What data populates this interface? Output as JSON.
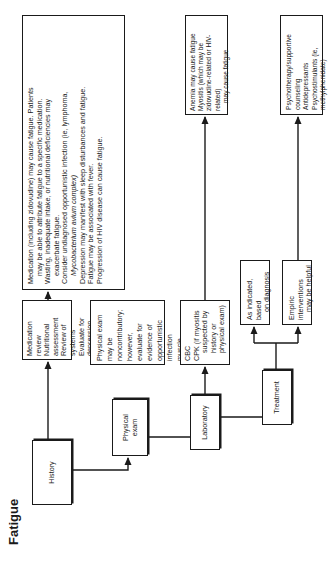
{
  "title": "Fatigue",
  "steps": [
    {
      "label": "History"
    },
    {
      "label": "Physical exam"
    },
    {
      "label": "Laboratory"
    },
    {
      "label": "Treatment"
    }
  ],
  "history_detail": {
    "lines": [
      "Medication review",
      "Nutritional assessment",
      "Review of systems",
      "Evaluate for depression"
    ]
  },
  "history_outcome": {
    "lines": [
      {
        "text": "Medication (including zidovudine) may cause fatigue. Patients",
        "indent": false
      },
      {
        "text": "may be able to attribute fatigue to a specific medication.",
        "indent": true
      },
      {
        "text": "Wasting, inadequate intake, or nutritional deficiencies may",
        "indent": false
      },
      {
        "text": "exacerbate fatigue.",
        "indent": true
      },
      {
        "text": "Consider undiagnosed opportunistic infection (ie, lymphoma,",
        "indent": false
      },
      {
        "text": "Mycobacterium avium complex)",
        "indent": true,
        "italic_part": "Mycobacterium avium"
      },
      {
        "text": "Depression may manifest with sleep disturbances and fatigue.",
        "indent": false
      },
      {
        "text": "Fatigue may be associated with fever.",
        "indent": false
      },
      {
        "text": "Progression of HIV disease can cause fatigue.",
        "indent": false
      }
    ]
  },
  "physical_detail": {
    "lines": [
      "Physical exam may be",
      "noncontributory; however,",
      "evaluate for evidence of",
      "opportunistic infection",
      "muscle weakness, or",
      "tenderness."
    ]
  },
  "lab_detail": {
    "lines": [
      {
        "text": "CBC",
        "indent": false
      },
      {
        "text": "CPK (if myositis",
        "indent": false
      },
      {
        "text": "suspected by history or",
        "indent": true
      },
      {
        "text": "physical exam)",
        "indent": true
      }
    ]
  },
  "lab_outcome": {
    "lines": [
      {
        "text": "Anemia may cause fatigue",
        "indent": false
      },
      {
        "text": "Myositis (which may be zidovudine-related or HIV-related)",
        "indent": false
      },
      {
        "text": "may cause fatigue",
        "indent": true
      }
    ]
  },
  "treatment_options": [
    {
      "lines": [
        "As indicated, based",
        "on diagnosis"
      ]
    },
    {
      "lines": [
        "Empiric interventions",
        "may be helpful"
      ]
    }
  ],
  "treatment_outcome": {
    "lines": [
      "Psychotherapy/supportive counseling",
      "Antidepressants",
      "Psychostimulants (ie, methylphenidate)"
    ]
  }
}
